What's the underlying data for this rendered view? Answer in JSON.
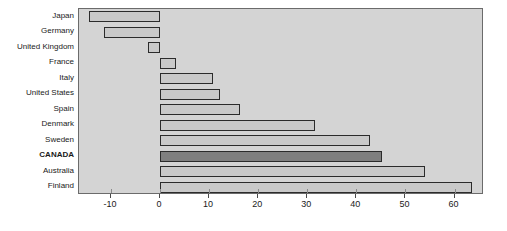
{
  "chart_data": {
    "type": "bar",
    "orientation": "horizontal",
    "title": "",
    "subtitle": "",
    "xlabel": "",
    "ylabel": "",
    "xlim": [
      -16.5,
      66.0
    ],
    "xticks": [
      -10,
      0,
      10,
      20,
      30,
      40,
      50,
      60
    ],
    "xtick_labels": [
      "-10",
      "0",
      "10",
      "20",
      "30",
      "40",
      "50",
      "60"
    ],
    "grid": false,
    "legend": "none",
    "zero_line": 0,
    "categories": [
      "Japan",
      "Germany",
      "United Kingdom",
      "France",
      "Italy",
      "United States",
      "Spain",
      "Denmark",
      "Sweden",
      "CANADA",
      "Australia",
      "Finland"
    ],
    "values": [
      -14.5,
      -11.5,
      -2.5,
      3.2,
      10.8,
      12.2,
      16.3,
      31.6,
      42.7,
      45.3,
      54.0,
      63.5
    ],
    "highlight_category": "CANADA",
    "colors": {
      "bar_fill": "#c9c9c9",
      "bar_highlight_fill": "#7f7f7f",
      "bar_border": "#2b2b2b",
      "plot_background": "#d4d4d4",
      "plot_border": "#6b6b6b",
      "text": "#1a1a1a",
      "page_background": "#ffffff"
    }
  }
}
